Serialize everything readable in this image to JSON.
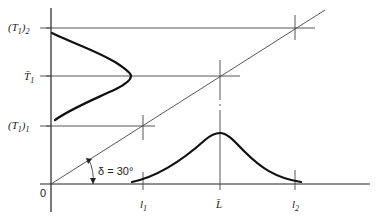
{
  "diagram": {
    "axes": {
      "origin_label": "0",
      "x_ticks": [
        {
          "id": "l1",
          "label": "l",
          "sub": "1"
        },
        {
          "id": "Lbar",
          "label": "L̄",
          "sub": ""
        },
        {
          "id": "l2",
          "label": "l",
          "sub": "2"
        }
      ],
      "y_ticks": [
        {
          "id": "T1_2",
          "label": "(T",
          "sub1": "1",
          "mid": ")",
          "sub2": "2"
        },
        {
          "id": "T1bar",
          "label": "T̄",
          "sub1": "1"
        },
        {
          "id": "T1_1",
          "label": "(T",
          "sub1": "1",
          "mid": ")",
          "sub2": "1"
        }
      ]
    },
    "angle_annotation": {
      "symbol": "δ",
      "text": "δ = 30°",
      "value_deg": 30
    },
    "curves": [
      {
        "name": "length-distribution",
        "axis": "x",
        "shape": "skewed-bell"
      },
      {
        "name": "T1-distribution",
        "axis": "y",
        "shape": "skewed-bell"
      }
    ]
  }
}
